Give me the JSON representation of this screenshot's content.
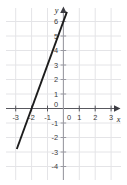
{
  "chart_data": {
    "type": "line",
    "title": "",
    "xlabel": "x",
    "ylabel": "y",
    "xlim": [
      -3.6,
      3.6
    ],
    "ylim": [
      -4.6,
      7.0
    ],
    "grid": true,
    "legend": "none",
    "x_ticks": [
      -3,
      -2,
      -1,
      0,
      1,
      2,
      3
    ],
    "x_tick_labels": [
      "-3",
      "-2",
      "-1",
      "0",
      "1",
      "2",
      "3"
    ],
    "y_ticks": [
      -4,
      -3,
      -2,
      -1,
      0,
      1,
      2,
      3,
      4,
      5,
      6
    ],
    "y_tick_labels": [
      "-4",
      "-3",
      "-2",
      "-1",
      "0",
      "1",
      "2",
      "3",
      "4",
      "5",
      "6"
    ],
    "origin_label": "0",
    "series": [
      {
        "name": "line",
        "equation": "y = 3x + 6",
        "slope": 3,
        "intercept": 6,
        "x_intercept": -2,
        "y_intercept": 6,
        "color": "#1c1c1c",
        "points": [
          {
            "x": -2.93,
            "y": -2.8
          },
          {
            "x": -2,
            "y": 0
          },
          {
            "x": -1,
            "y": 3
          },
          {
            "x": 0,
            "y": 6
          },
          {
            "x": 0.22,
            "y": 6.65
          }
        ],
        "x_start": -2.93,
        "x_end": 0.22
      }
    ],
    "colors": {
      "grid": "#e3e3e6",
      "axis": "#6f6f77",
      "curve": "#1c1c1c",
      "text": "#3a3a3a",
      "background": "#ffffff"
    }
  },
  "labels": {
    "x_axis_name": "x",
    "y_axis_name": "y"
  }
}
